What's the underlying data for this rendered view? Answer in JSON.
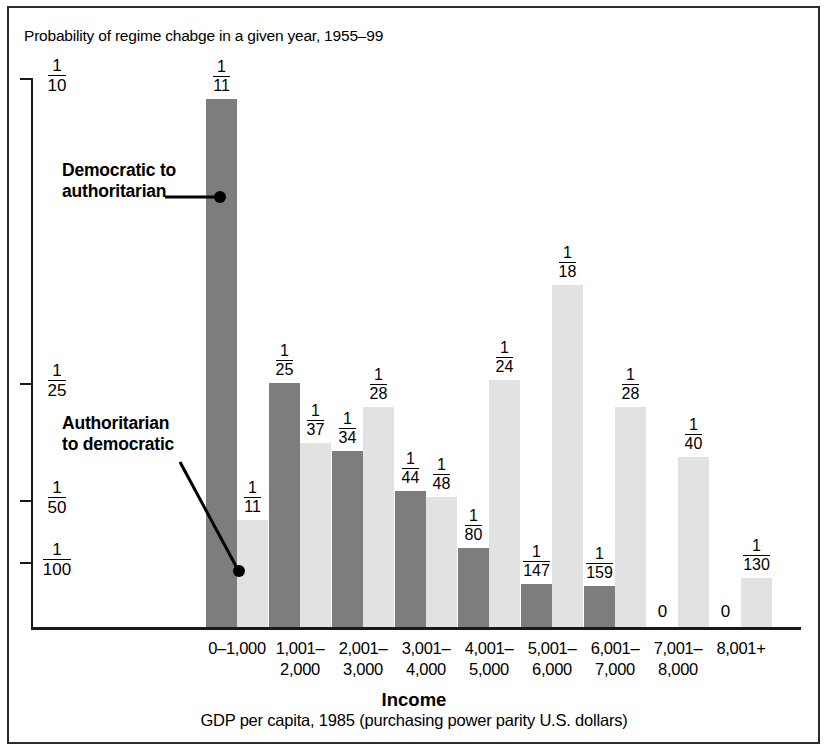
{
  "chart_title": "Probability of regime chabge in a given year, 1955–99",
  "axis": {
    "x_title": "Income",
    "x_subtitle": "GDP per capita, 1985 (purchasing power parity U.S. dollars)",
    "y_ticks": [
      {
        "num": "1",
        "den": "10",
        "y": 78
      },
      {
        "num": "1",
        "den": "25",
        "y": 383
      },
      {
        "num": "1",
        "den": "50",
        "y": 500
      },
      {
        "num": "1",
        "den": "100",
        "y": 562
      }
    ]
  },
  "annotations": [
    {
      "id": "dem-auth",
      "line1": "Democratic to",
      "line2": "authoritarian"
    },
    {
      "id": "auth-dem",
      "line1": "Authoritarian",
      "line2": "to democratic"
    }
  ],
  "colors": {
    "dark_bar": "#7d7d7d",
    "light_bar": "#e2e2e2",
    "axis": "#1a1a1a",
    "frame": "#2b2b2b",
    "text": "#000000"
  },
  "chart_data": {
    "type": "bar",
    "title": "Probability of regime chabge in a given year, 1955–99",
    "xlabel": "Income",
    "xlabel_sub": "GDP per capita, 1985 (purchasing power parity U.S. dollars)",
    "ylabel": "",
    "grid": false,
    "legend_position": "inline-annotations",
    "ytick_labels": [
      "1/10",
      "1/25",
      "1/50",
      "1/100"
    ],
    "ytick_values": [
      0.1,
      0.04,
      0.02,
      0.01
    ],
    "categories": [
      "0–1,000",
      "1,001–2,000",
      "2,001–3,000",
      "3,001–4,000",
      "4,001–5,000",
      "5,001–6,000",
      "6,001–7,000",
      "7,001–8,000",
      "8,001+"
    ],
    "series": [
      {
        "name": "Democratic to authoritarian",
        "color": "#7d7d7d",
        "labels": [
          "1/11",
          "1/25",
          "1/34",
          "1/44",
          "1/80",
          "1/147",
          "1/159",
          "0",
          "0"
        ],
        "values": [
          0.0909,
          0.04,
          0.0294,
          0.0227,
          0.0125,
          0.0068,
          0.0063,
          0,
          0
        ]
      },
      {
        "name": "Authoritarian to democratic",
        "color": "#e2e2e2",
        "labels": [
          "1/11",
          "1/37",
          "1/28",
          "1/48",
          "1/24",
          "1/18",
          "1/28",
          "1/40",
          "1/130"
        ],
        "values": [
          0.0182,
          0.027,
          0.0357,
          0.0208,
          0.0417,
          0.0556,
          0.0357,
          0.025,
          0.0077
        ]
      }
    ]
  },
  "bars": [
    {
      "cat": "0–1,000",
      "cat_l1": "0–1,000",
      "cat_l2": "",
      "gx": 174,
      "dark": {
        "label_num": "1",
        "label_den": "11",
        "x": 206,
        "w": 31,
        "top": 99,
        "zero": false
      },
      "light": {
        "label_num": "1",
        "label_den": "11",
        "x": 237,
        "w": 31,
        "top": 520,
        "zero": false
      }
    },
    {
      "cat": "1,001–2,000",
      "cat_l1": "1,001–",
      "cat_l2": "2,000",
      "gx": 254,
      "dark": {
        "label_num": "1",
        "label_den": "25",
        "x": 269,
        "w": 31,
        "top": 383,
        "zero": false
      },
      "light": {
        "label_num": "1",
        "label_den": "37",
        "x": 300,
        "w": 31,
        "top": 443,
        "zero": false
      }
    },
    {
      "cat": "2,001–3,000",
      "cat_l1": "2,001–",
      "cat_l2": "3,000",
      "gx": 317,
      "dark": {
        "label_num": "1",
        "label_den": "34",
        "x": 332,
        "w": 31,
        "top": 451,
        "zero": false
      },
      "light": {
        "label_num": "1",
        "label_den": "28",
        "x": 363,
        "w": 31,
        "top": 407,
        "zero": false
      }
    },
    {
      "cat": "3,001–4,000",
      "cat_l1": "3,001–",
      "cat_l2": "4,000",
      "gx": 380,
      "dark": {
        "label_num": "1",
        "label_den": "44",
        "x": 395,
        "w": 31,
        "top": 491,
        "zero": false
      },
      "light": {
        "label_num": "1",
        "label_den": "48",
        "x": 426,
        "w": 31,
        "top": 497,
        "zero": false
      }
    },
    {
      "cat": "4,001–5,000",
      "cat_l1": "4,001–",
      "cat_l2": "5,000",
      "gx": 443,
      "dark": {
        "label_num": "1",
        "label_den": "80",
        "x": 458,
        "w": 31,
        "top": 548,
        "zero": false
      },
      "light": {
        "label_num": "1",
        "label_den": "24",
        "x": 489,
        "w": 31,
        "top": 380,
        "zero": false
      }
    },
    {
      "cat": "5,001–6,000",
      "cat_l1": "5,001–",
      "cat_l2": "6,000",
      "gx": 506,
      "dark": {
        "label_num": "1",
        "label_den": "147",
        "x": 521,
        "w": 31,
        "top": 584,
        "zero": false
      },
      "light": {
        "label_num": "1",
        "label_den": "18",
        "x": 552,
        "w": 31,
        "top": 285,
        "zero": false
      }
    },
    {
      "cat": "6,001–7,000",
      "cat_l1": "6,001–",
      "cat_l2": "7,000",
      "gx": 569,
      "dark": {
        "label_num": "1",
        "label_den": "159",
        "x": 584,
        "w": 31,
        "top": 586,
        "zero": false
      },
      "light": {
        "label_num": "1",
        "label_den": "28",
        "x": 615,
        "w": 31,
        "top": 407,
        "zero": false
      }
    },
    {
      "cat": "7,001–8,000",
      "cat_l1": "7,001–",
      "cat_l2": "8,000",
      "gx": 632,
      "dark": {
        "label_num": "0",
        "label_den": "",
        "x": 647,
        "w": 31,
        "top": 627,
        "zero": true
      },
      "light": {
        "label_num": "1",
        "label_den": "40",
        "x": 678,
        "w": 31,
        "top": 457,
        "zero": false
      }
    },
    {
      "cat": "8,001+",
      "cat_l1": "8,001+",
      "cat_l2": "",
      "gx": 695,
      "dark": {
        "label_num": "0",
        "label_den": "",
        "x": 710,
        "w": 31,
        "top": 627,
        "zero": true
      },
      "light": {
        "label_num": "1",
        "label_den": "130",
        "x": 741,
        "w": 31,
        "top": 578,
        "zero": false
      }
    }
  ]
}
